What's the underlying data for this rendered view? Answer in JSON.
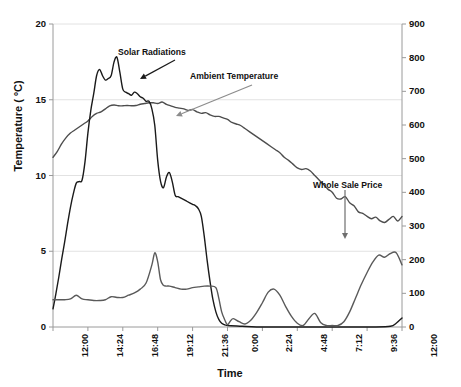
{
  "chart_data": {
    "type": "line",
    "title": "",
    "xlabel": "Time",
    "ylabel": "Temperature ( ºC)",
    "y2label": "Whole Sale Price ($ /MWh) / Solar Radiation (Watt/ m²)",
    "grid": true,
    "legend_position": "annotations-on-plot",
    "xlim": [
      0,
      24
    ],
    "ylim": [
      0,
      20
    ],
    "y2lim": [
      0,
      900
    ],
    "xtick_labels": [
      "12:00",
      "14:24",
      "16:48",
      "19:12",
      "21:36",
      "0:00",
      "2:24",
      "4:48",
      "7:12",
      "9:36",
      "12:00"
    ],
    "xtick_hours": [
      0,
      2.4,
      4.8,
      7.2,
      9.6,
      12,
      14.4,
      16.8,
      19.2,
      21.6,
      24
    ],
    "ytick_labels": [
      "0",
      "5",
      "10",
      "15",
      "20"
    ],
    "ytick_values": [
      0,
      5,
      10,
      15,
      20
    ],
    "y2tick_labels": [
      "0",
      "100",
      "200",
      "300",
      "400",
      "500",
      "600",
      "700",
      "800",
      "900"
    ],
    "y2tick_values": [
      0,
      100,
      200,
      300,
      400,
      500,
      600,
      700,
      800,
      900
    ],
    "annotations": [
      {
        "text": "Solar Radiations",
        "label_x": 118,
        "label_y": 47,
        "ax1": 175,
        "ay1": 60,
        "ax2": 140,
        "ay2": 79,
        "color": "#1a1a1a"
      },
      {
        "text": "Ambient Temperature",
        "label_x": 190,
        "label_y": 71,
        "ax1": 252,
        "ay1": 85,
        "ax2": 176,
        "ay2": 116,
        "color": "#8c8c8c"
      },
      {
        "text": "Whole Sale Price",
        "label_x": 313,
        "label_y": 180,
        "ax1": 345,
        "ay1": 190,
        "ax2": 345,
        "ay2": 239,
        "color": "#6e6e6e"
      }
    ],
    "series": [
      {
        "name": "Ambient Temperature",
        "axis": "left",
        "unit": "ºC",
        "color": "#4d4d4d",
        "x": [
          0,
          0.3,
          0.6,
          0.9,
          1.2,
          1.5,
          1.8,
          2.1,
          2.4,
          2.7,
          3.0,
          3.3,
          3.6,
          3.9,
          4.2,
          4.5,
          4.8,
          5.1,
          5.4,
          5.7,
          6.0,
          6.3,
          6.6,
          6.9,
          7.2,
          7.5,
          7.8,
          8.1,
          8.4,
          8.7,
          9.0,
          9.3,
          9.6,
          9.9,
          10.2,
          10.5,
          10.8,
          11.1,
          11.4,
          11.7,
          12.0,
          12.3,
          12.6,
          12.9,
          13.2,
          13.5,
          13.8,
          14.1,
          14.4,
          14.7,
          15.0,
          15.3,
          15.6,
          15.9,
          16.2,
          16.5,
          16.8,
          17.1,
          17.4,
          17.7,
          18.0,
          18.3,
          18.6,
          18.9,
          19.2,
          19.5,
          19.8,
          20.1,
          20.4,
          20.7,
          21.0,
          21.3,
          21.6,
          21.9,
          22.2,
          22.5,
          22.8,
          23.1,
          23.4,
          23.7,
          24.0
        ],
        "y": [
          11.2,
          11.6,
          12.1,
          12.5,
          12.8,
          13.0,
          13.2,
          13.4,
          13.6,
          13.9,
          14.1,
          14.2,
          14.4,
          14.6,
          14.65,
          14.6,
          14.6,
          14.62,
          14.6,
          14.62,
          14.7,
          14.75,
          14.8,
          14.8,
          14.75,
          14.85,
          14.7,
          14.6,
          14.5,
          14.45,
          14.4,
          14.3,
          14.35,
          14.2,
          14.1,
          14.15,
          14.0,
          13.9,
          13.9,
          13.8,
          13.7,
          13.5,
          13.4,
          13.3,
          13.1,
          12.9,
          12.7,
          12.5,
          12.3,
          12.1,
          11.9,
          11.7,
          11.5,
          11.2,
          11.0,
          10.75,
          10.5,
          10.4,
          10.45,
          10.3,
          10.0,
          9.7,
          9.4,
          9.1,
          8.9,
          8.5,
          8.45,
          8.6,
          8.2,
          8.0,
          7.6,
          7.5,
          7.3,
          7.15,
          7.25,
          7.0,
          6.9,
          7.1,
          7.3,
          7.0,
          7.3
        ],
        "end_values_note": "ends near 7.2"
      },
      {
        "name": "Solar Radiations",
        "axis": "right",
        "unit": "Watt/ m²",
        "color": "#1a1a1a",
        "x": [
          0,
          0.2,
          0.4,
          0.6,
          0.8,
          1.0,
          1.2,
          1.4,
          1.6,
          1.8,
          2.0,
          2.2,
          2.4,
          2.6,
          2.8,
          3.0,
          3.2,
          3.4,
          3.6,
          3.8,
          4.0,
          4.2,
          4.4,
          4.6,
          4.8,
          5.0,
          5.2,
          5.4,
          5.6,
          5.8,
          6.0,
          6.2,
          6.4,
          6.6,
          6.8,
          7.0,
          7.2,
          7.4,
          7.6,
          7.8,
          8.0,
          8.2,
          8.4,
          8.6,
          8.8,
          9.0,
          9.2,
          9.4,
          9.6,
          9.8,
          10.0,
          10.2,
          10.4,
          10.6,
          10.8,
          11.0,
          11.2,
          11.4,
          11.6,
          11.8,
          12.0,
          13.0,
          14.0,
          16.0,
          18.0,
          20.0,
          22.0,
          23.2,
          23.6,
          24.0
        ],
        "y_left_scale": [
          1.2,
          2.2,
          3.3,
          4.5,
          5.6,
          6.8,
          7.9,
          8.8,
          9.5,
          9.6,
          9.7,
          10.9,
          12.8,
          14.3,
          15.4,
          16.6,
          17.0,
          16.6,
          16.3,
          16.4,
          16.6,
          17.5,
          17.8,
          16.8,
          15.7,
          15.5,
          15.4,
          15.3,
          15.5,
          15.4,
          15.2,
          15.1,
          14.9,
          14.9,
          14.4,
          13.3,
          11.0,
          9.6,
          9.2,
          9.9,
          10.2,
          9.6,
          8.7,
          8.6,
          8.5,
          8.4,
          8.3,
          8.2,
          8.1,
          8.0,
          7.8,
          7.3,
          6.0,
          4.4,
          3.0,
          1.8,
          1.0,
          0.5,
          0.25,
          0.15,
          0.1,
          0.05,
          0.0,
          0.0,
          0.0,
          0.0,
          0.0,
          0.05,
          0.25,
          0.6
        ],
        "y": [
          54,
          99,
          149,
          202,
          252,
          306,
          356,
          396,
          428,
          432,
          437,
          490,
          576,
          644,
          693,
          747,
          765,
          747,
          734,
          738,
          747,
          788,
          801,
          756,
          707,
          698,
          693,
          689,
          698,
          693,
          684,
          680,
          671,
          671,
          648,
          599,
          495,
          432,
          414,
          446,
          459,
          432,
          392,
          387,
          383,
          378,
          374,
          369,
          365,
          360,
          351,
          329,
          270,
          198,
          135,
          81,
          45,
          23,
          11,
          7,
          5,
          2,
          0,
          0,
          0,
          0,
          0,
          2,
          11,
          27
        ],
        "peak": {
          "value": 801,
          "time": "16:24"
        }
      },
      {
        "name": "Whole Sale Price",
        "axis": "right",
        "unit": "$ /MWh",
        "color": "#5a5a5a",
        "x": [
          0,
          0.4,
          0.8,
          1.2,
          1.6,
          2.0,
          2.4,
          2.8,
          3.2,
          3.6,
          4.0,
          4.4,
          4.8,
          5.2,
          5.6,
          6.0,
          6.4,
          6.8,
          7.0,
          7.2,
          7.4,
          7.6,
          7.8,
          8.0,
          8.4,
          8.8,
          9.2,
          9.6,
          10.0,
          10.4,
          10.8,
          11.2,
          11.4,
          11.6,
          11.8,
          12.0,
          12.2,
          12.4,
          12.8,
          13.2,
          13.6,
          14.0,
          14.4,
          14.8,
          15.2,
          15.6,
          16.0,
          16.4,
          16.8,
          17.2,
          17.6,
          18.0,
          18.4,
          18.8,
          19.2,
          19.6,
          20.0,
          20.4,
          20.8,
          21.2,
          21.6,
          22.0,
          22.4,
          22.8,
          23.2,
          23.6,
          24.0
        ],
        "y_left_scale": [
          1.8,
          1.8,
          1.8,
          1.85,
          2.1,
          1.85,
          1.8,
          1.75,
          1.75,
          1.8,
          2.0,
          1.95,
          1.95,
          2.1,
          2.25,
          2.5,
          2.9,
          4.1,
          4.9,
          4.3,
          3.1,
          2.75,
          2.7,
          2.7,
          2.6,
          2.5,
          2.5,
          2.6,
          2.65,
          2.7,
          2.7,
          2.6,
          1.9,
          1.0,
          0.5,
          0.15,
          0.4,
          0.55,
          0.35,
          0.2,
          0.45,
          0.95,
          1.6,
          2.3,
          2.5,
          2.1,
          1.35,
          0.7,
          0.25,
          0.1,
          0.55,
          0.9,
          0.3,
          0.1,
          0.1,
          0.1,
          0.35,
          1.0,
          1.9,
          2.8,
          3.6,
          4.3,
          4.75,
          4.6,
          4.85,
          4.9,
          4.1
        ],
        "y": [
          81,
          81,
          81,
          83,
          95,
          83,
          81,
          79,
          79,
          81,
          90,
          88,
          88,
          95,
          101,
          112,
          131,
          185,
          221,
          194,
          140,
          124,
          122,
          122,
          117,
          113,
          113,
          117,
          119,
          122,
          122,
          117,
          86,
          45,
          23,
          7,
          18,
          25,
          16,
          9,
          20,
          43,
          72,
          104,
          113,
          95,
          61,
          32,
          11,
          5,
          25,
          41,
          14,
          5,
          5,
          5,
          16,
          45,
          86,
          126,
          162,
          194,
          214,
          207,
          218,
          221,
          185
        ],
        "peak": {
          "value": 221,
          "time": "19:00"
        },
        "tail_note": "declines to ~30 by 12:00"
      }
    ]
  },
  "plot": {
    "left_px": 53,
    "right_px": 402,
    "top_px": 24,
    "bottom_px": 327,
    "axis_color": "#9a9a9a",
    "grid_color": "#e2e2e2",
    "background": "#ffffff"
  }
}
